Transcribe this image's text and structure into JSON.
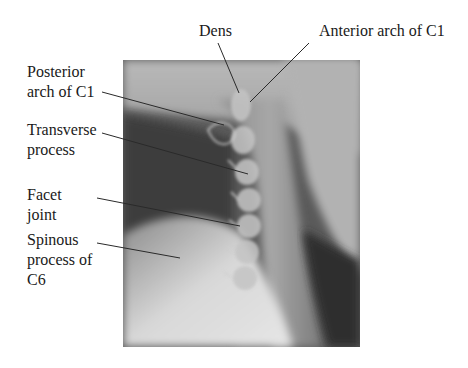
{
  "figure": {
    "labels": [
      {
        "id": "dens",
        "text": "Dens",
        "x": 199,
        "y": 21,
        "line": [
          218,
          43,
          239,
          93
        ]
      },
      {
        "id": "anterior-arch-c1",
        "text": "Anterior arch of C1",
        "x": 319,
        "y": 21,
        "line": [
          309,
          43,
          250,
          102
        ]
      },
      {
        "id": "posterior-arch-c1",
        "text": "Posterior\narch of C1",
        "x": 27,
        "y": 62,
        "line": [
          102,
          92,
          224,
          125
        ]
      },
      {
        "id": "transverse-process",
        "text": "Transverse\nprocess",
        "x": 27,
        "y": 120,
        "line": [
          102,
          133,
          248,
          174
        ]
      },
      {
        "id": "facet-joint",
        "text": "Facet\njoint",
        "x": 27,
        "y": 185,
        "line": [
          97,
          198,
          240,
          226
        ]
      },
      {
        "id": "spinous-process-c6",
        "text": "Spinous\nprocess of\nC6",
        "x": 27,
        "y": 230,
        "line": [
          97,
          243,
          180,
          258
        ]
      }
    ],
    "colors": {
      "leader_line": "#2a2a2a",
      "background": "#ffffff"
    }
  }
}
